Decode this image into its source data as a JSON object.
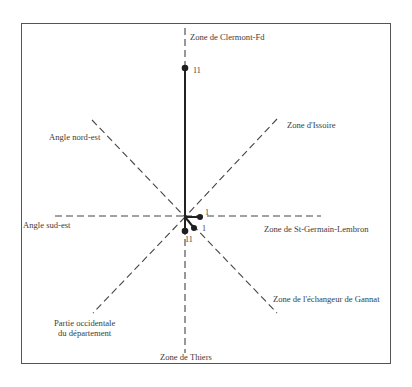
{
  "diagram": {
    "type": "radial-star",
    "center": {
      "x": 185,
      "y": 217
    },
    "axes": [
      {
        "id": "n",
        "label": "Zone de Clermont-Fd"
      },
      {
        "id": "ne",
        "label": "Zone d'Issoire"
      },
      {
        "id": "e",
        "label": "Zone de St-Germain-Lembron"
      },
      {
        "id": "se",
        "label": "Zone de l'échangeur de Gannat"
      },
      {
        "id": "s",
        "label": "Zone de Thiers"
      },
      {
        "id": "sw",
        "label_line1": "Partie occidentale",
        "label_line2": "du département"
      },
      {
        "id": "w",
        "label": "Angle sud-est"
      },
      {
        "id": "nw",
        "label": "Angle nord-est"
      }
    ],
    "values": [
      {
        "axis": "n",
        "value": "11"
      },
      {
        "axis": "e",
        "value": "1"
      },
      {
        "axis": "se",
        "value": "1"
      },
      {
        "axis": "s",
        "value": "11"
      }
    ],
    "colors": {
      "frame": "#555555",
      "axis_dash": "#444444",
      "value_line": "#222222",
      "text": "#3c3c3c"
    }
  }
}
